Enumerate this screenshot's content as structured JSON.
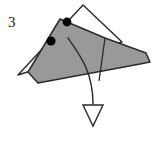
{
  "figure": {
    "step_label": "3",
    "type": "origami-fold-diagram",
    "canvas": {
      "width": 160,
      "height": 141
    },
    "colors": {
      "background": "#ffffff",
      "shape_fill": "#999999",
      "outline_fill": "#ffffff",
      "stroke": "#2a2a2a",
      "dot_fill": "#000000",
      "label_color": "#1a1a1a"
    },
    "shapes": {
      "outline_triangle": {
        "name": "white-outline-triangle",
        "points": "83,5 122,42 18,75"
      },
      "gray_shape": {
        "name": "gray-folded-flap",
        "points": "60,19 105,38 146,53 150,62 140,64 38,83 28,72"
      },
      "gray_inner_crease": {
        "name": "crease-line",
        "from": "105,38",
        "to": "98,80"
      }
    },
    "dots": [
      {
        "name": "fold-point-left",
        "cx": 51,
        "cy": 41,
        "r": 4.5
      },
      {
        "name": "fold-point-right",
        "cx": 67,
        "cy": 22,
        "r": 4.5
      }
    ],
    "arrow": {
      "name": "fold-direction-arrow",
      "path": "M 68,38 C 80,55 93,72 93,104",
      "head_points": "83,105 103,105 93,126",
      "head_filled": false
    },
    "label_position": {
      "x": 8,
      "y": 27
    }
  }
}
